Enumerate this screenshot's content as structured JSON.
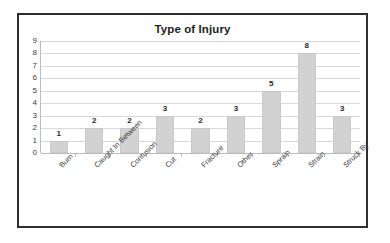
{
  "chart_data": {
    "type": "bar",
    "title": "Type of Injury",
    "xlabel": "",
    "ylabel": "",
    "ylim": [
      0,
      9
    ],
    "y_ticks": [
      9,
      8,
      7,
      6,
      5,
      4,
      3,
      2,
      1,
      0
    ],
    "grid": true,
    "legend": "none",
    "bar_color": "#d2d2d2",
    "categories": [
      "Burn",
      "Caught In Between",
      "Contusion",
      "Cut",
      "Fracture",
      "Other",
      "Sprain",
      "Strain",
      "Struck By"
    ],
    "values": [
      1,
      2,
      2,
      3,
      2,
      3,
      5,
      8,
      3
    ],
    "data_labels": [
      "1",
      "2",
      "2",
      "3",
      "2",
      "3",
      "5",
      "8",
      "3"
    ]
  },
  "figure": {
    "border_color": "#2f2f33",
    "background": "#ffffff"
  }
}
